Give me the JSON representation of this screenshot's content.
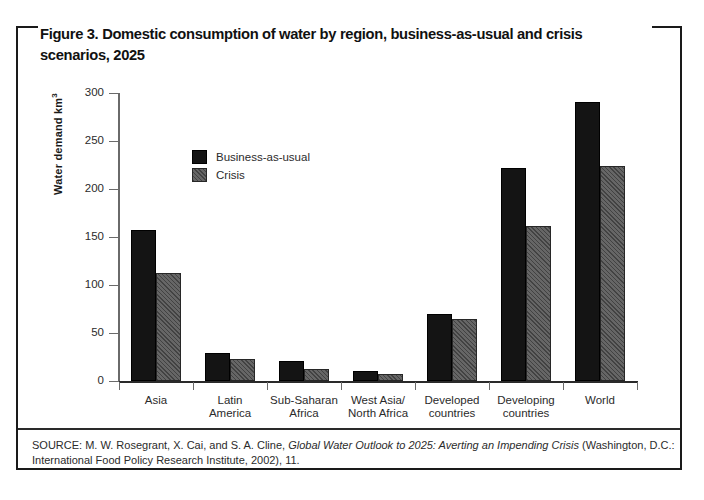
{
  "figure": {
    "title": "Figure 3. Domestic consumption of water by region, business-as-usual and crisis scenarios, 2025",
    "source_prefix": "SOURCE: M. W. Rosegrant, X. Cai, and S. A. Cline, ",
    "source_italic": "Global Water Outlook to 2025: Averting an Impending Crisis",
    "source_suffix": " (Washington, D.C.: International Food Policy Research Institute, 2002), 11."
  },
  "chart_data": {
    "type": "bar",
    "title": "Figure 3. Domestic consumption of water by region, business-as-usual and crisis scenarios, 2025",
    "xlabel": "",
    "ylabel": "Water demand km",
    "ylabel_superscript": "3",
    "ylim": [
      0,
      300
    ],
    "yticks": [
      0,
      50,
      100,
      150,
      200,
      250,
      300
    ],
    "ytick_labels": [
      "0",
      "50",
      "100",
      "150",
      "200",
      "250",
      "300"
    ],
    "grid": false,
    "legend_position": "upper-left-inside",
    "categories": [
      "Asia",
      "Latin\nAmerica",
      "Sub-Saharan\nAfrica",
      "West Asia/\nNorth Africa",
      "Developed\ncountries",
      "Developing\ncountries",
      "World"
    ],
    "series": [
      {
        "name": "Business-as-usual",
        "color": "#141414",
        "values": [
          157,
          29,
          21,
          10,
          70,
          222,
          291
        ]
      },
      {
        "name": "Crisis",
        "color": "#5e5e5e",
        "values": [
          112,
          23,
          13,
          7,
          65,
          161,
          224
        ]
      }
    ]
  }
}
